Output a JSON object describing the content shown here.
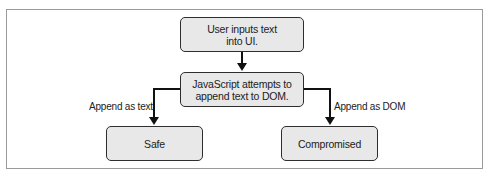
{
  "diagram": {
    "nodes": {
      "user_input": {
        "label": "User inputs text\ninto UI."
      },
      "js_append": {
        "label": "JavaScript attempts to\nappend text to DOM."
      },
      "safe": {
        "label": "Safe"
      },
      "compromised": {
        "label": "Compromised"
      }
    },
    "edges": {
      "input_to_js": {
        "from": "user_input",
        "to": "js_append",
        "label": ""
      },
      "js_to_safe": {
        "from": "js_append",
        "to": "safe",
        "label": "Append as text"
      },
      "js_to_compromised": {
        "from": "js_append",
        "to": "compromised",
        "label": "Append as DOM"
      }
    },
    "colors": {
      "node_fill": "#e8e8e8",
      "node_border": "#2e2e2e",
      "edge": "#111111",
      "frame": "#9a9a9a"
    }
  }
}
